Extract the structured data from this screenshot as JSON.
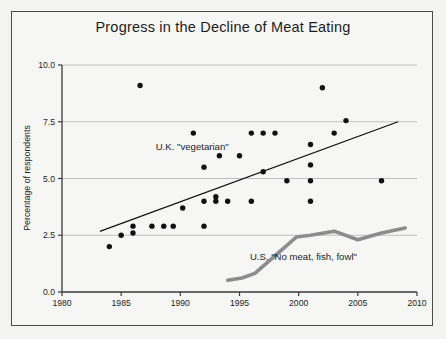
{
  "chart_data": {
    "type": "scatter",
    "title": "Progress in the Decline of Meat Eating",
    "xlabel": "",
    "ylabel": "Percentage of respondents",
    "xlim": [
      1980,
      2010
    ],
    "ylim": [
      0.0,
      10.0
    ],
    "xticks": [
      1980,
      1985,
      1990,
      1995,
      2000,
      2005,
      2010
    ],
    "xtick_labels": [
      "1980",
      "1985",
      "1990",
      "1995",
      "2000",
      "2005",
      "2010"
    ],
    "yticks": [
      0.0,
      2.5,
      5.0,
      7.5,
      10.0
    ],
    "ytick_labels": [
      "0.0",
      "2.5",
      "5.0",
      "7.5",
      "10.0"
    ],
    "grid": "horizontal",
    "legend_position": "inline-annotations",
    "series": [
      {
        "name": "U.K. \"vegetarian\"",
        "type": "scatter",
        "marker": "filled-circle",
        "color": "#111111",
        "points": [
          {
            "x": 1984.0,
            "y": 2.0
          },
          {
            "x": 1985.0,
            "y": 2.5
          },
          {
            "x": 1986.0,
            "y": 2.6
          },
          {
            "x": 1986.0,
            "y": 2.9
          },
          {
            "x": 1986.6,
            "y": 9.1
          },
          {
            "x": 1987.6,
            "y": 2.9
          },
          {
            "x": 1988.6,
            "y": 2.9
          },
          {
            "x": 1989.4,
            "y": 2.9
          },
          {
            "x": 1990.2,
            "y": 3.7
          },
          {
            "x": 1991.1,
            "y": 7.0
          },
          {
            "x": 1992.0,
            "y": 5.5
          },
          {
            "x": 1992.0,
            "y": 4.0
          },
          {
            "x": 1992.0,
            "y": 2.9
          },
          {
            "x": 1993.0,
            "y": 4.2
          },
          {
            "x": 1993.0,
            "y": 4.0
          },
          {
            "x": 1993.3,
            "y": 6.0
          },
          {
            "x": 1994.0,
            "y": 4.0
          },
          {
            "x": 1995.0,
            "y": 6.0
          },
          {
            "x": 1996.0,
            "y": 7.0
          },
          {
            "x": 1996.0,
            "y": 4.0
          },
          {
            "x": 1997.0,
            "y": 7.0
          },
          {
            "x": 1997.0,
            "y": 5.3
          },
          {
            "x": 1998.0,
            "y": 7.0
          },
          {
            "x": 1999.0,
            "y": 4.9
          },
          {
            "x": 2001.0,
            "y": 6.5
          },
          {
            "x": 2001.0,
            "y": 5.6
          },
          {
            "x": 2001.0,
            "y": 4.9
          },
          {
            "x": 2001.0,
            "y": 4.0
          },
          {
            "x": 2002.0,
            "y": 9.0
          },
          {
            "x": 2003.0,
            "y": 7.0
          },
          {
            "x": 2004.0,
            "y": 7.55
          },
          {
            "x": 2007.0,
            "y": 4.9
          }
        ],
        "trendline": {
          "x0": 1983.2,
          "y0": 2.67,
          "x1": 2008.4,
          "y1": 7.5,
          "color": "#111111"
        }
      },
      {
        "name": "U.S. \"No meat, fish, fowl\"",
        "type": "line",
        "color": "#8c8c8c",
        "points": [
          {
            "x": 1994.0,
            "y": 0.52
          },
          {
            "x": 1995.2,
            "y": 0.62
          },
          {
            "x": 1996.3,
            "y": 0.82
          },
          {
            "x": 1999.8,
            "y": 2.42
          },
          {
            "x": 2001.0,
            "y": 2.5
          },
          {
            "x": 2003.0,
            "y": 2.68
          },
          {
            "x": 2005.0,
            "y": 2.3
          },
          {
            "x": 2007.0,
            "y": 2.6
          },
          {
            "x": 2009.0,
            "y": 2.82
          }
        ]
      }
    ],
    "annotations": [
      {
        "text": "U.K. \"vegetarian\"",
        "x": 1991.0,
        "y": 6.25
      },
      {
        "text": "U.S. \"No meat, fish, fowl\"",
        "x": 2000.4,
        "y": 1.42
      }
    ]
  },
  "colors": {
    "background": "#f3f3f2",
    "frame": "#4a4a4a",
    "axis": "#3a3a3a",
    "grid": "#b9b9b9",
    "uk_points": "#111111",
    "us_line": "#8c8c8c",
    "text": "#1d1d1d"
  }
}
